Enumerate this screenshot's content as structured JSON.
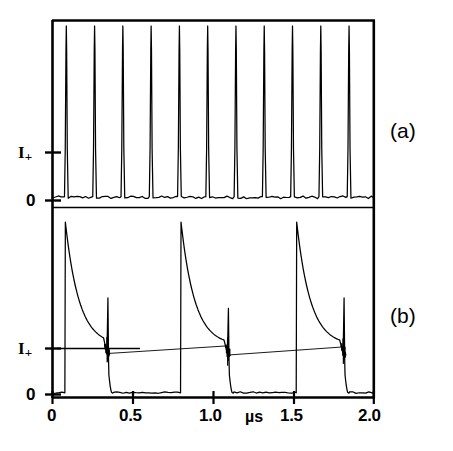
{
  "figure": {
    "background_color": "#ffffff",
    "trace_color": "#000000",
    "axis_color": "#000000"
  },
  "axes": {
    "x_unit": "µs",
    "x_ticks": [
      {
        "value": 0,
        "label": "0"
      },
      {
        "value": 0.5,
        "label": "0.5"
      },
      {
        "value": 1.0,
        "label": "1.0"
      },
      {
        "value": 1.5,
        "label": "1.5"
      },
      {
        "value": 2.0,
        "label": "2.0"
      }
    ],
    "y_tick_zero": "0",
    "y_tick_current": "I",
    "y_tick_current_sub": "+"
  },
  "panels": [
    {
      "id": "a",
      "label": "(a)"
    },
    {
      "id": "b",
      "label": "(b)"
    }
  ],
  "chart_data": {
    "type": "line",
    "title": "",
    "xlabel": "µs",
    "ylabel": "I+",
    "xlim": [
      0,
      2.0
    ],
    "grid": false,
    "legend": "none",
    "subplots": [
      {
        "name": "(a)",
        "description": "Periodic narrow current spikes, ~11 pulses over 2 microseconds, baseline at 0, I+ reference level marked on axis.",
        "y_reference_levels": {
          "zero": 0,
          "I_plus": 0.25
        },
        "ylim": [
          0,
          1.0
        ],
        "pulse_period_us": 0.176,
        "pulse_count": 11,
        "pulse_width_us": 0.012,
        "pulse_peak": 1.0,
        "pulse_times_us": [
          0.086,
          0.262,
          0.438,
          0.614,
          0.79,
          0.966,
          1.142,
          1.318,
          1.494,
          1.67,
          1.846
        ]
      },
      {
        "name": "(b)",
        "description": "Three long current pulses: fast rise to peak, exponential decay toward I+ level, small ringing spike at the trailing edge, then fall to zero and flat until the next pulse.",
        "y_reference_levels": {
          "zero": 0,
          "I_plus": 0.3
        },
        "ylim": [
          0,
          1.0
        ],
        "pulse_period_us": 0.72,
        "pulse_count": 3,
        "pulses": [
          {
            "rise_us": 0.08,
            "peak": 1.0,
            "decay_tau_us": 0.085,
            "plateau": 0.285,
            "ring_time_us": 0.345,
            "ring_peak": 0.56,
            "fall_us": 0.375
          },
          {
            "rise_us": 0.8,
            "peak": 1.0,
            "decay_tau_us": 0.085,
            "plateau": 0.285,
            "ring_time_us": 1.095,
            "ring_peak": 0.5,
            "fall_us": 1.125
          },
          {
            "rise_us": 1.52,
            "peak": 1.0,
            "decay_tau_us": 0.085,
            "plateau": 0.285,
            "ring_time_us": 1.815,
            "ring_peak": 0.56,
            "fall_us": 1.845
          }
        ]
      }
    ]
  }
}
